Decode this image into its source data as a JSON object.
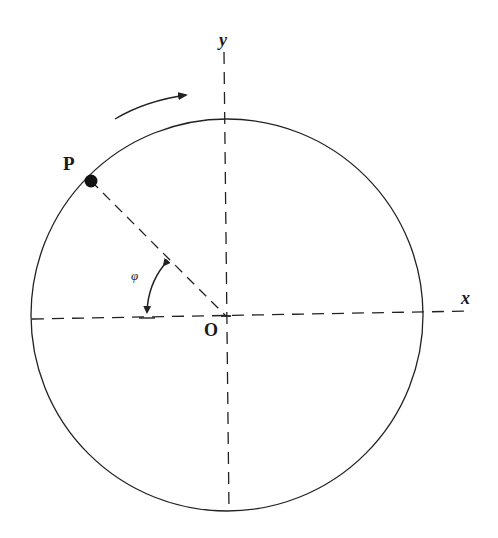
{
  "diagram": {
    "type": "circle-rotation-diagram",
    "labels": {
      "point": "P",
      "origin": "O",
      "x_axis": "x",
      "y_axis": "y",
      "angle": "φ"
    },
    "geometry": {
      "center": [
        226,
        316
      ],
      "radius": 197,
      "point_P": [
        91,
        181
      ],
      "rotation_direction": "clockwise"
    },
    "colors": {
      "stroke": "#222222",
      "background": "#ffffff"
    }
  }
}
